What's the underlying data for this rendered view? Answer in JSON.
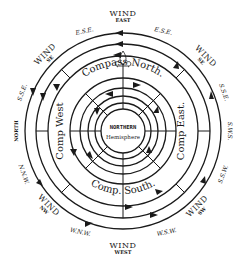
{
  "diagram": {
    "type": "concentric wind-circulation compass diagram",
    "center": {
      "line1": "NORTHERN",
      "line2": "Hemisphere"
    },
    "compass_labels": {
      "north": "Compass North.",
      "east": "Comp East.",
      "south": "Comp. South.",
      "west": "Comp West"
    },
    "wind_labels": {
      "top": {
        "word": "WIND",
        "dir": "EAST"
      },
      "upper_left": {
        "word": "WIND",
        "dir": "SE"
      },
      "upper_right": {
        "word": "WIND",
        "dir": "SE"
      },
      "left": {
        "word": "NORTH"
      },
      "right": {
        "word": "S.W.S."
      },
      "lower_left": {
        "word": "WIND",
        "dir": "NW"
      },
      "lower_right": {
        "word": "WIND",
        "dir": "SW"
      },
      "bottom": {
        "word": "WIND",
        "dir": "WEST"
      }
    },
    "intermediate_labels": {
      "top_left": "E.S.E.",
      "top_right": "E.S.E.",
      "upper_left_side": "S.S.E.",
      "upper_right_side": "S.S.E.",
      "lower_left_side": "N.N.W.",
      "lower_right_side": "S.S.W.",
      "bottom_left": "W.N.W.",
      "bottom_right": "W.S.W."
    }
  }
}
